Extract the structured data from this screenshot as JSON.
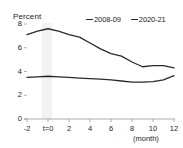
{
  "chart_data": {
    "type": "line",
    "title": "",
    "ylabel": "Percent",
    "xlabel": "(month)",
    "ylim": [
      0,
      8
    ],
    "yticks": [
      0,
      2,
      4,
      6,
      8
    ],
    "ytick_labels": [
      "0",
      "2",
      "4",
      "6",
      "8"
    ],
    "xlim": [
      -2,
      12
    ],
    "xticks": [
      -2,
      0,
      2,
      4,
      6,
      8,
      10,
      12
    ],
    "xtick_labels": [
      "-2",
      "t=0",
      "2",
      "4",
      "6",
      "8",
      "10",
      "12"
    ],
    "grid": false,
    "legend_position": "top-right",
    "x": [
      -2,
      -1,
      0,
      1,
      2,
      3,
      4,
      5,
      6,
      7,
      8,
      9,
      10,
      11,
      12
    ],
    "series": [
      {
        "name": "2008-09",
        "color": "#2a2a2a",
        "values": [
          7.1,
          7.4,
          7.6,
          7.4,
          7.1,
          6.9,
          6.4,
          5.9,
          5.5,
          5.3,
          4.8,
          4.4,
          4.5,
          4.5,
          4.3
        ]
      },
      {
        "name": "2020-21",
        "color": "#2a2a2a",
        "values": [
          3.5,
          3.55,
          3.6,
          3.55,
          3.5,
          3.45,
          3.4,
          3.35,
          3.3,
          3.2,
          3.1,
          3.1,
          3.15,
          3.3,
          3.65
        ]
      }
    ],
    "shaded_band": {
      "from": -0.6,
      "to": 0.4,
      "color": "#f2f2f2"
    }
  }
}
